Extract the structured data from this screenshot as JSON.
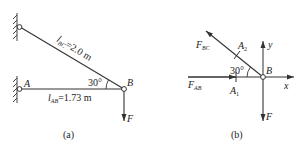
{
  "figure_a": {
    "caption": "(a)",
    "point_A": "A",
    "point_B": "B",
    "angle": "30°",
    "rod_BC_label_sym": "l",
    "rod_BC_label_sub": "BC",
    "rod_BC_label_val": "=2.0 m",
    "rod_AB_label_sym": "l",
    "rod_AB_label_sub": "AB",
    "rod_AB_label_val": "=1.73 m",
    "force": "F"
  },
  "figure_b": {
    "caption": "(b)",
    "point_B": "B",
    "angle": "30°",
    "force_BC_sym": "F",
    "force_BC_sub": "BC",
    "force_AB_sym": "F",
    "force_AB_sub": "AB",
    "section_A1_sym": "A",
    "section_A1_sub": "1",
    "section_A2_sym": "A",
    "section_A2_sub": "2",
    "axis_x": "x",
    "axis_y": "y",
    "force": "F"
  },
  "colors": {
    "line": "#333333",
    "background": "#ffffff"
  }
}
